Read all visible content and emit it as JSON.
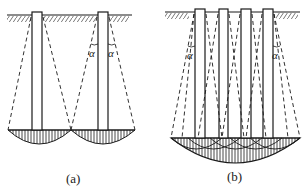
{
  "figures": [
    {
      "id": "a",
      "label": "(a)",
      "caption_pos": {
        "x": 66,
        "y": 171
      },
      "description": "Two widely spaced piles, each with a stress-spreading cone at angle alpha and separate bulb-shaped stress zones at pile tips",
      "angle_symbol": "α"
    },
    {
      "id": "b",
      "label": "(b)",
      "caption_pos": {
        "x": 227,
        "y": 169
      },
      "description": "Four closely spaced piles (pile group) with overlapping stress cones at angle alpha, forming a combined stress bulb",
      "angle_symbol": "α"
    }
  ],
  "colors": {
    "line": "#1a1a1a",
    "background": "#ffffff"
  }
}
